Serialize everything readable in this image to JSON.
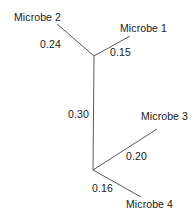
{
  "figure": {
    "type": "unrooted-phylogenetic-tree",
    "background_color": "#ffffff",
    "line_color": "#555a5e",
    "text_color": "#202020"
  },
  "taxa": [
    {
      "id": "microbe-2",
      "label": "Microbe 2",
      "x": 14,
      "y": 12
    },
    {
      "id": "microbe-1",
      "label": "Microbe 1",
      "x": 120,
      "y": 23
    },
    {
      "id": "microbe-3",
      "label": "Microbe 3",
      "x": 141,
      "y": 111
    },
    {
      "id": "microbe-4",
      "label": "Microbe 4",
      "x": 126,
      "y": 199
    }
  ],
  "branch_lengths": [
    {
      "id": "branch-microbe-2",
      "label": "0.24",
      "value": 0.24,
      "x": 40,
      "y": 39
    },
    {
      "id": "branch-microbe-1",
      "label": "0.15",
      "value": 0.15,
      "x": 110,
      "y": 47
    },
    {
      "id": "branch-internal",
      "label": "0.30",
      "value": 0.3,
      "x": 68,
      "y": 109
    },
    {
      "id": "branch-microbe-3",
      "label": "0.20",
      "value": 0.2,
      "x": 126,
      "y": 151
    },
    {
      "id": "branch-microbe-4",
      "label": "0.16",
      "value": 0.16,
      "x": 92,
      "y": 183
    }
  ],
  "edges": [
    {
      "id": "edge-microbe-2",
      "from": "node-top",
      "to": "microbe-2",
      "x1": 94,
      "y1": 56,
      "x2": 57,
      "y2": 24
    },
    {
      "id": "edge-microbe-1",
      "from": "node-top",
      "to": "microbe-1",
      "x1": 94,
      "y1": 56,
      "x2": 130,
      "y2": 36
    },
    {
      "id": "edge-internal",
      "from": "node-top",
      "to": "node-bottom",
      "x1": 94,
      "y1": 56,
      "x2": 93,
      "y2": 170
    },
    {
      "id": "edge-microbe-3",
      "from": "node-bottom",
      "to": "microbe-3",
      "x1": 93,
      "y1": 170,
      "x2": 157,
      "y2": 129
    },
    {
      "id": "edge-microbe-4",
      "from": "node-bottom",
      "to": "microbe-4",
      "x1": 93,
      "y1": 170,
      "x2": 141,
      "y2": 197
    }
  ],
  "nodes": [
    {
      "id": "node-top",
      "x": 94,
      "y": 56
    },
    {
      "id": "node-bottom",
      "x": 93,
      "y": 170
    }
  ]
}
